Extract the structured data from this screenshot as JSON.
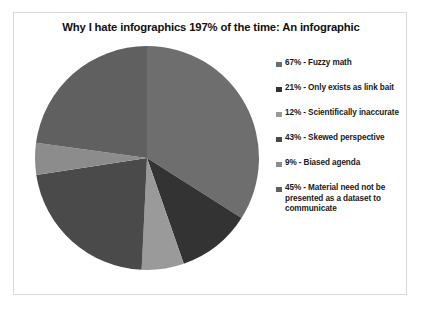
{
  "chart": {
    "title": "Why I hate infographics 197% of the time: An infographic",
    "border_color": "#d9d9d9",
    "background": "#ffffff"
  },
  "chart_data": {
    "type": "pie",
    "title": "Why I hate infographics 197% of the time: An infographic",
    "total": 197,
    "legend_position": "right",
    "categories": [
      "Fuzzy math",
      "Only exists as link bait",
      "Scientifically inaccurate",
      "Skewed perspective",
      "Biased agenda",
      "Material need not be presented as a dataset to communicate"
    ],
    "values": [
      67,
      21,
      12,
      43,
      9,
      45
    ],
    "colors": [
      "#6e6e6e",
      "#333333",
      "#9a9a9a",
      "#4a4a4a",
      "#8c8c8c",
      "#606060"
    ],
    "slices": [
      {
        "label": "67% - Fuzzy math",
        "value": 67,
        "color": "#6e6e6e"
      },
      {
        "label": "21% - Only exists as link bait",
        "value": 21,
        "color": "#333333"
      },
      {
        "label": "12%  - Scientifically inaccurate",
        "value": 12,
        "color": "#9a9a9a"
      },
      {
        "label": "43% - Skewed perspective",
        "value": 43,
        "color": "#4a4a4a"
      },
      {
        "label": "9% - Biased agenda",
        "value": 9,
        "color": "#8c8c8c"
      },
      {
        "label": "45% - Material need not be presented as a dataset to communicate",
        "value": 45,
        "color": "#606060"
      }
    ]
  },
  "legend": {
    "items": [
      {
        "label": "67% - Fuzzy math",
        "color": "#6e6e6e"
      },
      {
        "label": "21% - Only exists as link bait",
        "color": "#333333"
      },
      {
        "label": "12%  - Scientifically inaccurate",
        "color": "#9a9a9a"
      },
      {
        "label": "43% - Skewed perspective",
        "color": "#4a4a4a"
      },
      {
        "label": "9% - Biased agenda",
        "color": "#8c8c8c"
      },
      {
        "label": "45% - Material need not be presented as a dataset to communicate",
        "color": "#606060"
      }
    ]
  }
}
